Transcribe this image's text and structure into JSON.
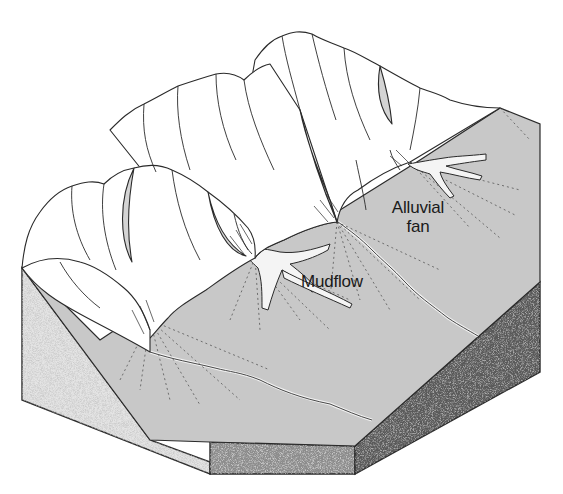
{
  "figure": {
    "labels": [
      {
        "id": "alluvial_fan",
        "lines": [
          "Alluvial",
          "fan"
        ]
      },
      {
        "id": "mudflow",
        "lines": [
          "Mudflow"
        ]
      }
    ],
    "colors": {
      "background": "#ffffff",
      "valley_floor": "#c9c9c9",
      "mountain_fill": "#ffffff",
      "mountain_shadow": "#d4d4d4",
      "line": "#2a2a2a",
      "block_side_left": "#e2e2e2",
      "block_side_front": "#8a8a8a",
      "block_side_right": "#555555"
    }
  }
}
